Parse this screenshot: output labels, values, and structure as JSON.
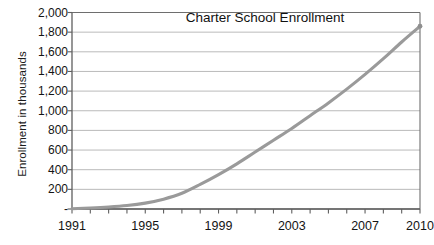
{
  "chart_data": {
    "type": "line",
    "title": "Charter School Enrollment",
    "xlabel": "",
    "ylabel": "Enrollment in thousands",
    "xlim": [
      1991,
      2010
    ],
    "ylim": [
      0,
      2000
    ],
    "grid": true,
    "legend": "none",
    "line_color": "#9a9a9a",
    "marker_color": "#8f8f8f",
    "x": [
      1991,
      1992,
      1993,
      1994,
      1995,
      1996,
      1997,
      1998,
      1999,
      2000,
      2001,
      2002,
      2003,
      2004,
      2005,
      2006,
      2007,
      2008,
      2009,
      2010
    ],
    "values": [
      3,
      10,
      20,
      35,
      60,
      100,
      160,
      250,
      350,
      460,
      580,
      700,
      820,
      950,
      1080,
      1220,
      1370,
      1530,
      1700,
      1860
    ],
    "series": [
      {
        "name": "Charter School Enrollment",
        "values": [
          3,
          10,
          20,
          35,
          60,
          100,
          160,
          250,
          350,
          460,
          580,
          700,
          820,
          950,
          1080,
          1220,
          1370,
          1530,
          1700,
          1860
        ]
      }
    ],
    "y_tick_labels": [
      "2,000",
      "1,800",
      "1,600",
      "1,400",
      "1,200",
      "1,000",
      "800",
      "600",
      "400",
      "200",
      "-"
    ],
    "y_tick_values": [
      2000,
      1800,
      1600,
      1400,
      1200,
      1000,
      800,
      600,
      400,
      200,
      0
    ],
    "x_tick_labels": [
      "1991",
      "1995",
      "1999",
      "2003",
      "2007",
      "2010"
    ],
    "x_tick_values": [
      1991,
      1995,
      1999,
      2003,
      2007,
      2010
    ]
  },
  "axis": {
    "y_title": "Enrollment in thousands"
  },
  "title": {
    "text": "Charter School Enrollment"
  }
}
